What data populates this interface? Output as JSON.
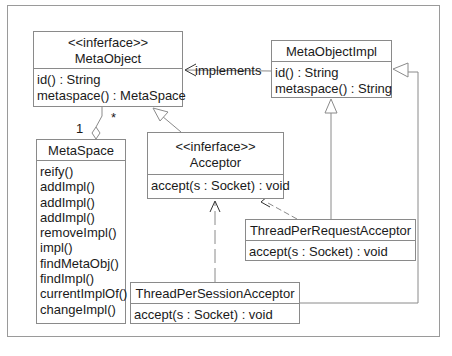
{
  "diagram": {
    "type": "UML class diagram",
    "classes": {
      "metaobject": {
        "stereotype": "<<inferface>>",
        "name": "MetaObject",
        "operations": [
          "id() : String",
          "metaspace() : MetaSpace"
        ]
      },
      "metaobjectimpl": {
        "name": "MetaObjectImpl",
        "operations": [
          "id() : String",
          "metaspace() : String"
        ]
      },
      "metaspace": {
        "name": "MetaSpace",
        "operations": [
          "reify()",
          "addImpl()",
          "addImpl()",
          "addImpl()",
          "removeImpl()",
          "impl()",
          "findMetaObj()",
          "findImpl()",
          "currentImplOf()",
          "changeImpl()"
        ]
      },
      "acceptor": {
        "stereotype": "<<inferface>>",
        "name": "Acceptor",
        "operations": [
          "accept(s : Socket) : void"
        ]
      },
      "threadperrequest": {
        "name": "ThreadPerRequestAcceptor",
        "operations": [
          "accept(s : Socket) : void"
        ]
      },
      "threadpersession": {
        "name": "ThreadPerSessionAcceptor",
        "operations": [
          "accept(s : Socket) : void"
        ]
      }
    },
    "relations": {
      "implements_label": "implements",
      "multiplicity_one": "1",
      "multiplicity_many": "*"
    },
    "colors": {
      "line": "#8a8a8a",
      "text": "#1a1a1a",
      "background": "#ffffff"
    }
  }
}
